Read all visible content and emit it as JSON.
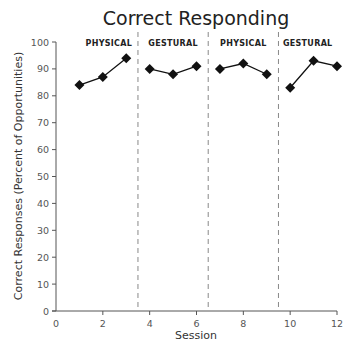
{
  "chart_data": {
    "type": "line",
    "title": "Correct Responding",
    "xlabel": "Session",
    "ylabel": "Correct Responses (Percent of Opportunities)",
    "xlim": [
      0,
      12
    ],
    "ylim": [
      0,
      100
    ],
    "x_ticks": [
      0,
      2,
      4,
      6,
      8,
      10,
      12
    ],
    "y_ticks": [
      0,
      10,
      20,
      30,
      40,
      50,
      60,
      70,
      80,
      90,
      100
    ],
    "grid": false,
    "legend": null,
    "marker": "diamond",
    "phase_change_lines": [
      3.5,
      6.5,
      9.5
    ],
    "phases": [
      {
        "label": "PHYSICAL",
        "x": [
          1,
          2,
          3
        ],
        "y": [
          84,
          87,
          94
        ]
      },
      {
        "label": "GESTURAL",
        "x": [
          4,
          5,
          6
        ],
        "y": [
          90,
          88,
          91
        ]
      },
      {
        "label": "PHYSICAL",
        "x": [
          7,
          8,
          9
        ],
        "y": [
          90,
          92,
          88
        ]
      },
      {
        "label": "GESTURAL",
        "x": [
          10,
          11,
          12
        ],
        "y": [
          83,
          93,
          91
        ]
      }
    ],
    "series": [
      {
        "name": "Correct Responding",
        "x": [
          1,
          2,
          3,
          4,
          5,
          6,
          7,
          8,
          9,
          10,
          11,
          12
        ],
        "values": [
          84,
          87,
          94,
          90,
          88,
          91,
          90,
          92,
          88,
          83,
          93,
          91
        ]
      }
    ]
  },
  "colors": {
    "line": "#111111",
    "axis": "#555555",
    "phase_line": "#888888"
  }
}
